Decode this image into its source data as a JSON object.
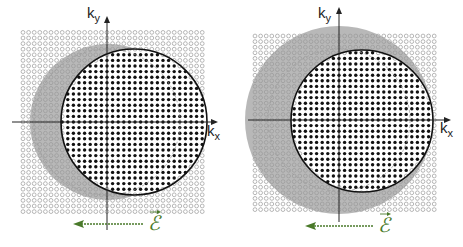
{
  "colors": {
    "empty_state": "#9a9a9a",
    "occupied_state": "#111111",
    "shifted_sphere_fill": "#b8b8b8",
    "fermi_circle": "#111111",
    "original_circle": "#9a9a9a",
    "axis": "#222222",
    "field_arrow": "#4a7a2a"
  },
  "grid": {
    "spacing": 5.6,
    "empty_radius": 1.9,
    "occupied_radius": 1.7
  },
  "panels": [
    {
      "id": "left",
      "axes": {
        "origin": [
          107,
          122
        ],
        "x_from": 12,
        "x_to": 213,
        "y_from": 230,
        "y_to": 21
      },
      "grid_box": {
        "x0": 18,
        "x1": 206,
        "y0": 32,
        "y1": 212
      },
      "shifted_sphere": {
        "cx": 108,
        "cy": 122,
        "r": 78
      },
      "occupied_circle": {
        "cx": 134,
        "cy": 122,
        "r": 73
      },
      "original_circle": {
        "cx": 107,
        "cy": 122,
        "r": 73
      },
      "labels": {
        "ky": "k",
        "ky_sub": "y",
        "kx": "k",
        "kx_sub": "x"
      },
      "ky_label_pos": [
        87,
        18
      ],
      "kx_label_pos": [
        207,
        136
      ],
      "field": {
        "x_start": 143,
        "x_end": 73,
        "y": 224,
        "label": "ℰ",
        "label_pos": [
          148,
          230
        ]
      }
    },
    {
      "id": "right",
      "axes": {
        "origin": [
          339,
          120
        ],
        "x_from": 248,
        "x_to": 446,
        "y_from": 222,
        "y_to": 12
      },
      "grid_box": {
        "x0": 251,
        "x1": 437,
        "y0": 31,
        "y1": 212
      },
      "shifted_sphere": {
        "cx": 339,
        "cy": 120,
        "r": 94
      },
      "occupied_circle": {
        "cx": 362,
        "cy": 121,
        "r": 71
      },
      "original_circle": {
        "cx": 339,
        "cy": 120,
        "r": 71
      },
      "labels": {
        "ky": "k",
        "ky_sub": "y",
        "kx": "k",
        "kx_sub": "x"
      },
      "ky_label_pos": [
        318,
        18
      ],
      "kx_label_pos": [
        440,
        133
      ],
      "field": {
        "x_start": 373,
        "x_end": 305,
        "y": 226,
        "label": "ℰ",
        "label_pos": [
          378,
          232
        ]
      }
    }
  ]
}
